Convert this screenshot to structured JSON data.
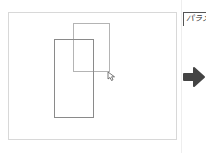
{
  "canvas": {
    "shapes": [
      {
        "type": "rectangle",
        "role": "dragged-rectangle",
        "color": "#b4b4b4"
      },
      {
        "type": "rectangle",
        "role": "original-rectangle",
        "color": "#8a8a8a"
      }
    ],
    "cursor": "pointer-cursor"
  },
  "side_panel": {
    "label": "パラメ",
    "arrow_icon": "arrow-right-icon",
    "arrow_color": "#444444"
  }
}
